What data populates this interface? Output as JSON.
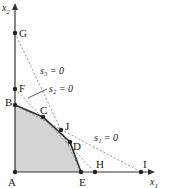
{
  "diagram": {
    "axes": {
      "x_label": "x",
      "x_sub": "1",
      "y_label": "x",
      "y_sub": "2"
    },
    "points": {
      "A": "A",
      "B": "B",
      "C": "C",
      "D": "D",
      "E": "E",
      "F": "F",
      "G": "G",
      "H": "H",
      "I": "I",
      "J": "J"
    },
    "constraints": {
      "s1": "s₁ = 0",
      "s2": "s₂ = 0",
      "s3": "s₃ = 0"
    },
    "colors": {
      "feasible_fill": "#d4d4d4",
      "line": "#333333",
      "dashed": "#777777"
    }
  }
}
